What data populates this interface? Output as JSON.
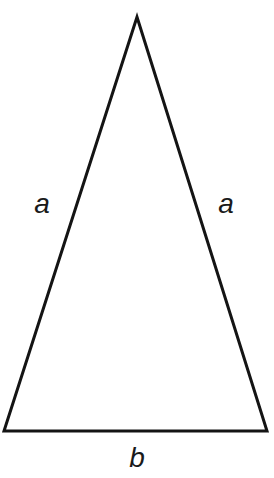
{
  "figure": {
    "name": "isosceles-triangle",
    "background_color": "#ffffff",
    "stroke_color": "#141414",
    "stroke_width": 3,
    "label_color": "#1a1a1a"
  },
  "geometry": {
    "apex": {
      "x": 137,
      "y": 17
    },
    "bottom_left": {
      "x": 4,
      "y": 431
    },
    "bottom_right": {
      "x": 267,
      "y": 431
    },
    "points_attr": "137,17 267,431 4,431"
  },
  "labels": {
    "left_side": "a",
    "right_side": "a",
    "base": "b"
  }
}
